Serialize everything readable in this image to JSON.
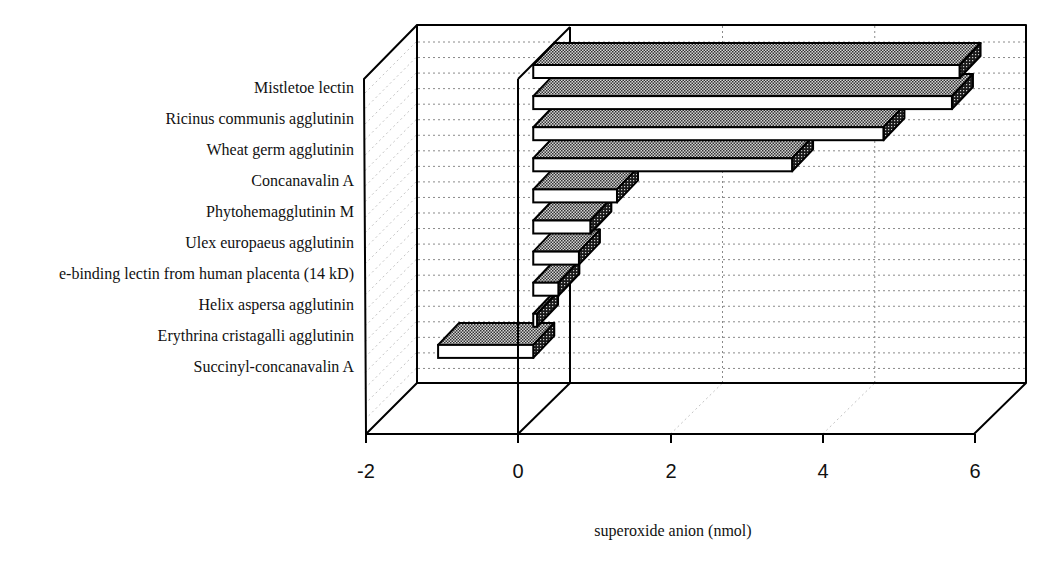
{
  "chart_data": {
    "type": "bar",
    "orientation": "horizontal",
    "style": "3d",
    "title": "",
    "xlabel": "superoxide anion (nmol)",
    "ylabel": "",
    "categories": [
      "Mistletoe lectin",
      "Ricinus communis agglutinin",
      "Wheat germ agglutinin",
      "Concanavalin A",
      "Phytohemagglutinin M",
      "Ulex europaeus agglutinin",
      "e-binding lectin from human placenta (14 kD)",
      "Helix aspersa agglutinin",
      "Erythrina cristagalli agglutinin",
      "Succinyl-concanavalin A"
    ],
    "values": [
      5.6,
      5.5,
      4.6,
      3.4,
      1.1,
      0.75,
      0.6,
      0.33,
      0.05,
      -1.25
    ],
    "xlim": [
      -2,
      6
    ],
    "x_ticks": [
      "-2",
      "0",
      "2",
      "4",
      "6"
    ],
    "grid": true,
    "legend": null
  },
  "colors": {
    "background": "#ffffff",
    "axis": "#000000",
    "bar_front": "#ffffff",
    "bar_top_stipple": "#333333",
    "bar_end_stipple": "#111111",
    "gridline": "#8a8a8a"
  }
}
